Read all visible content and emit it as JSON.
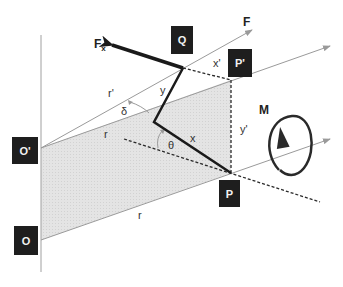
{
  "diagram": {
    "type": "force-moment vector diagram",
    "colors": {
      "shaded_plane": "#e6e6e6",
      "thin_line": "#9a9a9a",
      "thick_line": "#1a1a1a",
      "label_box": "#1e1e1e",
      "label_box_text": "#f2f2f2"
    },
    "points": {
      "O": "O",
      "O_prime": "O'",
      "P": "P",
      "P_prime": "P'",
      "Q": "Q"
    },
    "vectors": {
      "F": "F",
      "Fx": "F",
      "Fx_sub": "x",
      "M": "M"
    },
    "labels": {
      "r_bottom": "r",
      "r_mid": "r",
      "r_prime": "r'",
      "delta": "δ",
      "theta": "θ",
      "x": "x",
      "y": "y",
      "x_prime": "x'",
      "y_prime": "y'"
    }
  }
}
